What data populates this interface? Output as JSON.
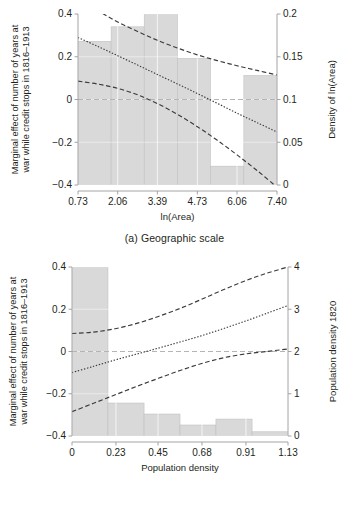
{
  "figure": {
    "panels": [
      {
        "id": "a",
        "caption": "(a) Geographic scale"
      },
      {
        "id": "b",
        "caption": "(b) Initial wealth"
      }
    ]
  },
  "chart_data": [
    {
      "type": "line",
      "id": "panel-a",
      "title": "(a) Geographic scale",
      "xlabel": "ln(Area)",
      "ylabel": "Marginal effect of number of years at war while credit stops in 1816–1913",
      "ylabel_line1": "Marginal effect of number of years at",
      "ylabel_line2": "war while credit stops in 1816–1913",
      "y2label": "Density of ln(Area)",
      "xlim": [
        0.73,
        7.4
      ],
      "ylim": [
        -0.4,
        0.4
      ],
      "y2lim": [
        0,
        0.2
      ],
      "xticks": [
        "0.73",
        "2.06",
        "3.39",
        "4.73",
        "6.06",
        "7.40"
      ],
      "xtick_values": [
        0.73,
        2.06,
        3.39,
        4.73,
        6.06,
        7.4
      ],
      "yticks": [
        "0.4",
        "0.2",
        "0",
        "-0.2",
        "-0.4"
      ],
      "ytick_values": [
        0.4,
        0.2,
        0,
        -0.2,
        -0.4
      ],
      "y2ticks": [
        "0.2",
        "0.15",
        "0.1",
        "0.05",
        "0"
      ],
      "y2tick_values": [
        0.2,
        0.15,
        0.1,
        0.05,
        0
      ],
      "grid": true,
      "legend": "none",
      "zero_reference_line": 0,
      "series": [
        {
          "name": "upper confidence bound",
          "style": "dashed",
          "x": [
            0.73,
            1.4,
            2.06,
            2.73,
            3.39,
            4.06,
            4.73,
            5.4,
            6.06,
            6.73,
            7.4
          ],
          "values": [
            0.47,
            0.415,
            0.363,
            0.318,
            0.277,
            0.241,
            0.209,
            0.182,
            0.158,
            0.136,
            0.115
          ]
        },
        {
          "name": "point estimate",
          "style": "dotted",
          "x": [
            0.73,
            1.4,
            2.06,
            2.73,
            3.39,
            4.06,
            4.73,
            5.4,
            6.06,
            6.73,
            7.4
          ],
          "values": [
            0.29,
            0.248,
            0.205,
            0.161,
            0.117,
            0.073,
            0.028,
            -0.018,
            -0.064,
            -0.108,
            -0.152
          ]
        },
        {
          "name": "lower confidence bound",
          "style": "dashed",
          "x": [
            0.73,
            1.4,
            2.06,
            2.73,
            3.39,
            4.06,
            4.73,
            5.4,
            6.06,
            6.73,
            7.4
          ],
          "values": [
            0.086,
            0.072,
            0.052,
            0.022,
            -0.019,
            -0.069,
            -0.127,
            -0.191,
            -0.259,
            -0.332,
            -0.41
          ]
        }
      ],
      "histogram": {
        "name": "Density of ln(Area)",
        "bin_edges": [
          0.73,
          1.84,
          2.95,
          4.06,
          5.17,
          6.29,
          7.4
        ],
        "densities": [
          0.168,
          0.185,
          0.2,
          0.148,
          0.022,
          0.128
        ]
      }
    },
    {
      "type": "line",
      "id": "panel-b",
      "title": "(b) Initial wealth",
      "xlabel": "Population density",
      "ylabel": "Marginal effect of number of years at war while credit stops in 1816–1913",
      "ylabel_line1": "Marginal effect of number of years at",
      "ylabel_line2": "war while credit stops in 1816–1913",
      "y2label": "Population density 1820",
      "xlim": [
        0,
        1.13
      ],
      "ylim": [
        -0.4,
        0.4
      ],
      "y2lim": [
        0,
        4
      ],
      "xticks": [
        "0",
        "0.23",
        "0.45",
        "0.68",
        "0.91",
        "1.13"
      ],
      "xtick_values": [
        0,
        0.23,
        0.45,
        0.68,
        0.91,
        1.13
      ],
      "yticks": [
        "0.4",
        "0.2",
        "0",
        "-0.2",
        "-0.4"
      ],
      "ytick_values": [
        0.4,
        0.2,
        0,
        -0.2,
        -0.4
      ],
      "y2ticks": [
        "4",
        "3",
        "2",
        "1",
        "0"
      ],
      "y2tick_values": [
        4,
        3,
        2,
        1,
        0
      ],
      "grid": true,
      "legend": "none",
      "zero_reference_line": 0,
      "series": [
        {
          "name": "upper confidence bound",
          "style": "dashed",
          "x": [
            0,
            0.113,
            0.226,
            0.339,
            0.452,
            0.565,
            0.678,
            0.791,
            0.904,
            1.017,
            1.13
          ],
          "values": [
            0.085,
            0.092,
            0.108,
            0.133,
            0.166,
            0.204,
            0.247,
            0.292,
            0.334,
            0.37,
            0.4
          ]
        },
        {
          "name": "point estimate",
          "style": "dotted",
          "x": [
            0,
            0.113,
            0.226,
            0.339,
            0.452,
            0.565,
            0.678,
            0.791,
            0.904,
            1.017,
            1.13
          ],
          "values": [
            -0.1,
            -0.07,
            -0.04,
            -0.012,
            0.016,
            0.045,
            0.075,
            0.108,
            0.143,
            0.18,
            0.218
          ]
        },
        {
          "name": "lower confidence bound",
          "style": "dashed",
          "x": [
            0,
            0.113,
            0.226,
            0.339,
            0.452,
            0.565,
            0.678,
            0.791,
            0.904,
            1.017,
            1.13
          ],
          "values": [
            -0.285,
            -0.245,
            -0.205,
            -0.165,
            -0.127,
            -0.09,
            -0.057,
            -0.03,
            -0.012,
            0.0,
            0.012
          ]
        }
      ],
      "histogram": {
        "name": "Population density 1820",
        "bin_edges": [
          0,
          0.188,
          0.377,
          0.565,
          0.753,
          0.942,
          1.13
        ],
        "densities": [
          4.2,
          0.78,
          0.52,
          0.26,
          0.4,
          0.1
        ]
      }
    }
  ],
  "style": {
    "bar_fill": "#d9d9d9",
    "bar_stroke": "#c0c0c0",
    "grid_color": "#e6e6e6",
    "axis_color": "#9a9a9a",
    "curve_color": "#3a3a3a",
    "zero_line_color": "#b5b5b5",
    "text_color": "#231f20"
  }
}
